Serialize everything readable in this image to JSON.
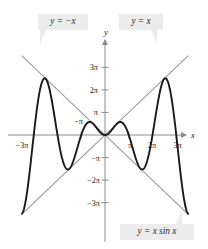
{
  "figure": {
    "title": "",
    "background": "#ffffff"
  },
  "colors": {
    "curve": "#1a1a1a",
    "envelope": "#9a9a9a",
    "axis": "#8c8c8c",
    "callout_bg": "#ececed",
    "text": "#2b2b2b"
  },
  "callouts": [
    {
      "id": "neg-x",
      "label": "y = −x"
    },
    {
      "id": "pos-x",
      "label": "y = x"
    },
    {
      "id": "curve",
      "label": "y = x sin x"
    }
  ],
  "axes": {
    "x_name": "x",
    "y_name": "y",
    "x_ticks": [
      {
        "value": -3,
        "label": "−3π"
      },
      {
        "value": 1,
        "label": "π"
      },
      {
        "value": 2,
        "label": "2π"
      },
      {
        "value": 3,
        "label": "3π"
      }
    ],
    "y_ticks": [
      {
        "value": 3,
        "label": "3π"
      },
      {
        "value": 2,
        "label": "2π"
      },
      {
        "value": 1,
        "label": "π"
      },
      {
        "value": -1,
        "label": "−π"
      },
      {
        "value": -2,
        "label": "−2π"
      },
      {
        "value": -3,
        "label": "−3π"
      }
    ],
    "inner_label": "−π"
  },
  "chart_data": {
    "type": "line",
    "title": "",
    "xlabel": "x",
    "ylabel": "y",
    "xlim": [
      -3.6,
      3.6
    ],
    "ylim": [
      -3.8,
      3.8
    ],
    "x_unit": "pi",
    "y_unit": "pi",
    "grid": false,
    "legend": "callouts",
    "series": [
      {
        "name": "y = x sin x",
        "color": "#1a1a1a",
        "width": 1.9,
        "expression": "x*sin(x)",
        "note": "x and y measured in units of pi; y_pi = (x_pi*pi*sin(x_pi*pi))/pi",
        "key_points": [
          {
            "x": -3.5,
            "y": -3.5
          },
          {
            "x": -2.5,
            "y": 2.46
          },
          {
            "x": -1.5,
            "y": -1.43
          },
          {
            "x": -0.5,
            "y": 0.5
          },
          {
            "x": 0,
            "y": 0
          },
          {
            "x": 0.5,
            "y": 0.5
          },
          {
            "x": 1.5,
            "y": -1.43
          },
          {
            "x": 2.5,
            "y": 2.46
          },
          {
            "x": 3.5,
            "y": -3.5
          }
        ]
      },
      {
        "name": "y = x",
        "color": "#9a9a9a",
        "width": 1.1,
        "expression": "x",
        "key_points": [
          {
            "x": -3.45,
            "y": -3.45
          },
          {
            "x": 3.45,
            "y": 3.45
          }
        ]
      },
      {
        "name": "y = −x",
        "color": "#9a9a9a",
        "width": 1.1,
        "expression": "-x",
        "key_points": [
          {
            "x": -3.45,
            "y": 3.45
          },
          {
            "x": 3.45,
            "y": -3.45
          }
        ]
      }
    ]
  }
}
